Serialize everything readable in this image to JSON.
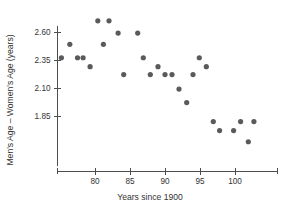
{
  "chart_data": {
    "type": "scatter",
    "title": "",
    "xlabel": "Years since 1900",
    "ylabel": "Men's Age – Women's Age (years)",
    "xlim": [
      74.3,
      103.8
    ],
    "ylim": [
      1.49,
      2.76
    ],
    "grid": false,
    "legend": null,
    "marker_color": "#5a5a5a",
    "axis_color": "#4d4d4d",
    "xticks": [
      80,
      85,
      90,
      95,
      100
    ],
    "xtick_labels": [
      "80",
      "85",
      "90",
      "95",
      "100"
    ],
    "yticks": [
      2.6,
      2.35,
      2.1,
      1.85
    ],
    "ytick_labels": [
      "2.60",
      "2.35",
      "2.10",
      "1.85"
    ],
    "points": [
      {
        "x": 75.2,
        "y": 2.37
      },
      {
        "x": 76.4,
        "y": 2.49
      },
      {
        "x": 77.5,
        "y": 2.37
      },
      {
        "x": 78.3,
        "y": 2.37
      },
      {
        "x": 79.3,
        "y": 2.29
      },
      {
        "x": 80.4,
        "y": 2.7
      },
      {
        "x": 81.2,
        "y": 2.49
      },
      {
        "x": 82.0,
        "y": 2.7
      },
      {
        "x": 83.3,
        "y": 2.59
      },
      {
        "x": 84.1,
        "y": 2.22
      },
      {
        "x": 86.1,
        "y": 2.59
      },
      {
        "x": 86.9,
        "y": 2.37
      },
      {
        "x": 87.9,
        "y": 2.22
      },
      {
        "x": 89.0,
        "y": 2.29
      },
      {
        "x": 90.0,
        "y": 2.22
      },
      {
        "x": 91.0,
        "y": 2.22
      },
      {
        "x": 92.0,
        "y": 2.09
      },
      {
        "x": 93.1,
        "y": 1.97
      },
      {
        "x": 94.0,
        "y": 2.22
      },
      {
        "x": 94.9,
        "y": 2.37
      },
      {
        "x": 95.9,
        "y": 2.29
      },
      {
        "x": 96.9,
        "y": 1.8
      },
      {
        "x": 97.8,
        "y": 1.72
      },
      {
        "x": 99.8,
        "y": 1.72
      },
      {
        "x": 100.8,
        "y": 1.8
      },
      {
        "x": 101.9,
        "y": 1.62
      },
      {
        "x": 102.7,
        "y": 1.8
      }
    ]
  },
  "axes": {
    "x_axis_label": "Years since 1900",
    "y_axis_label": "Men's Age – Women's Age (years)"
  }
}
